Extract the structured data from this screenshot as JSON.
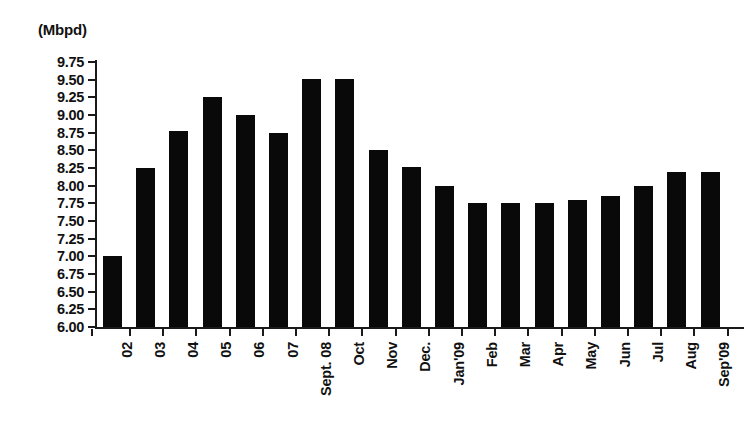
{
  "unit_label": "(Mbpd)",
  "chart_data": {
    "type": "bar",
    "title": "",
    "subtitle": "",
    "xlabel": "",
    "ylabel": "(Mbpd)",
    "ylim": [
      6.0,
      9.75
    ],
    "grid": false,
    "legend": "none",
    "bar_color": "#090909",
    "axis_color": "#1a1a1a",
    "ytick_labels": [
      "9.75",
      "9.50",
      "9.25",
      "9.00",
      "8.75",
      "8.50",
      "8.25",
      "8.00",
      "7.75",
      "7.50",
      "7.25",
      "7.00",
      "6.75",
      "6.50",
      "6.25",
      "6.00"
    ],
    "ytick_values": [
      9.75,
      9.5,
      9.25,
      9.0,
      8.75,
      8.5,
      8.25,
      8.0,
      7.75,
      7.5,
      7.25,
      7.0,
      6.75,
      6.5,
      6.25,
      6.0
    ],
    "categories": [
      "02",
      "03",
      "04",
      "05",
      "06",
      "07",
      "Sept. 08",
      "Oct",
      "Nov",
      "Dec.",
      "Jan'09",
      "Feb",
      "Mar",
      "Apr",
      "May",
      "Jun",
      "Jul",
      "Aug",
      "Sep'09"
    ],
    "values": [
      7.0,
      8.25,
      8.77,
      9.25,
      9.0,
      8.75,
      9.51,
      9.51,
      8.5,
      8.26,
      8.0,
      7.75,
      7.75,
      7.75,
      7.8,
      7.85,
      8.0,
      8.2,
      8.2
    ]
  }
}
